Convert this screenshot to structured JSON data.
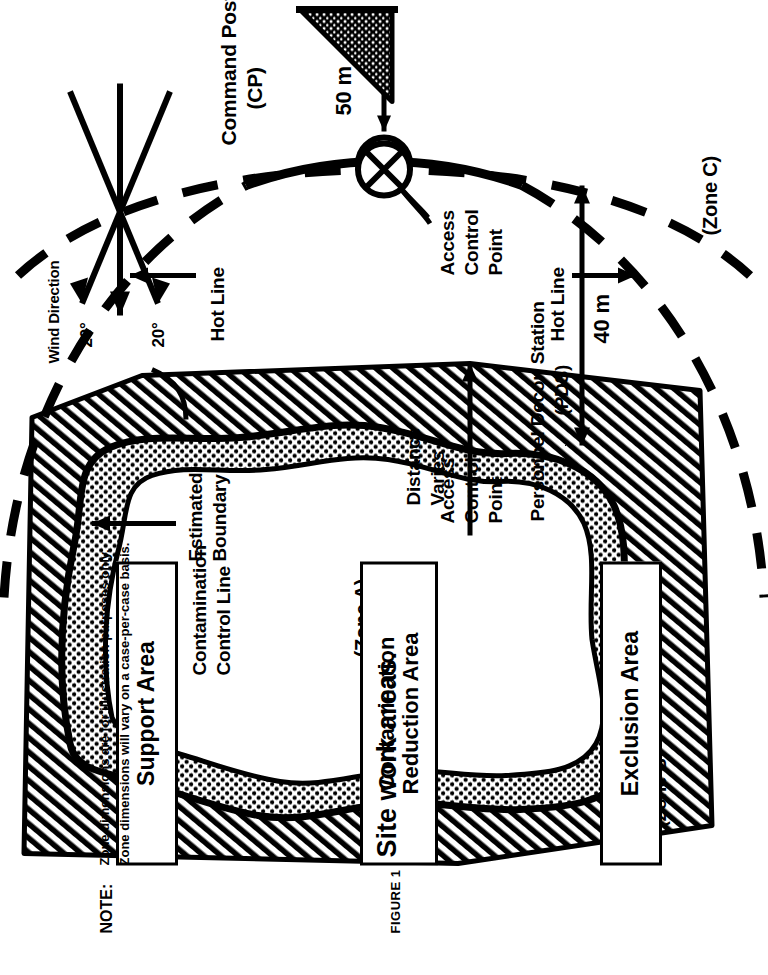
{
  "figure": {
    "caption_id": "FIGURE 1",
    "title": "Site work areas."
  },
  "note": {
    "label": "NOTE:",
    "line1": "Zone dimensions are for illustration purposes only.",
    "line2": "Zone dimensions will vary on a case-per-case basis."
  },
  "wind": {
    "label": "Wind Direction",
    "angle_left": "20°",
    "angle_right": "20°"
  },
  "command_post": {
    "line1": "Command Post",
    "line2": "(CP)"
  },
  "dimensions": {
    "cp_to_acp": "50 m",
    "pds_to_ccl": "40 m",
    "distance_varies_line1": "Distance",
    "distance_varies_line2": "Varies"
  },
  "annotations": {
    "contamination_control_line": "Contamination\nControl Line",
    "hot_line_upper": "Hot Line",
    "hot_line_lower": "Hot Line",
    "access_control_point_outer_l1": "Access",
    "access_control_point_outer_l2": "Control",
    "access_control_point_outer_l3": "Point",
    "access_control_point_inner_l1": "Access",
    "access_control_point_inner_l2": "Control",
    "access_control_point_inner_l3": "Point",
    "personnel_decon_station_l1": "Personnel Decon Station",
    "personnel_decon_station_l2": "(PDS)",
    "estimated_boundary_l1": "Estimated",
    "estimated_boundary_l2": "Boundary"
  },
  "zones": {
    "zone_a": "(Zone A)",
    "zone_b": "(Zone B)",
    "zone_c": "(Zone C)"
  },
  "area_boxes": [
    {
      "name": "support-area",
      "label": "Support Area"
    },
    {
      "name": "contamination-reduction-area",
      "label": "Contamination\nReduction Area"
    },
    {
      "name": "exclusion-area",
      "label": "Exclusion Area"
    }
  ],
  "colors": {
    "ink": "#000000",
    "paper": "#ffffff"
  }
}
